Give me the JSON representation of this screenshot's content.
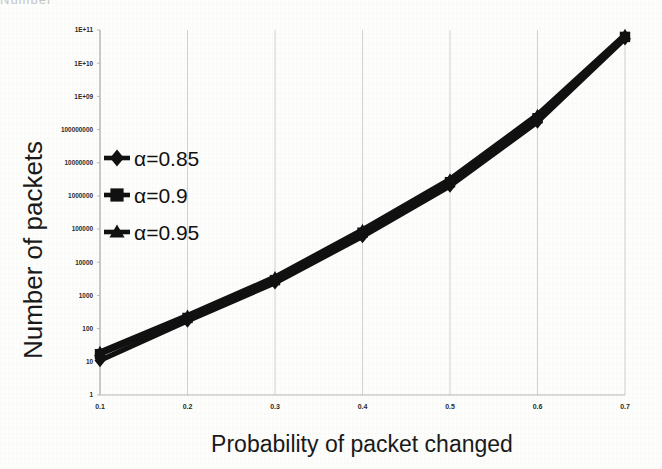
{
  "clipped_header": "Number",
  "chart_data": {
    "type": "line",
    "title": "",
    "xlabel": "Probability of  packet  changed",
    "ylabel": "Number of packets",
    "xscale": "linear",
    "yscale": "log",
    "xlim": [
      0.1,
      0.7
    ],
    "ylim": [
      1,
      100000000000
    ],
    "grid": true,
    "legend_position": "upper-left-inside",
    "x": [
      0.1,
      0.2,
      0.3,
      0.4,
      0.5,
      0.6,
      0.7
    ],
    "xtick_labels": [
      "0.1",
      "0.2",
      "0.3",
      "0.4",
      "0.5",
      "0.6",
      "0.7"
    ],
    "ytick_labels": [
      "1",
      "10",
      "100",
      "1000",
      "10000",
      "100000",
      "1000000",
      "10000000",
      "100000000",
      "1E+09",
      "1E+10",
      "1E+11"
    ],
    "ytick_values": [
      1,
      10,
      100,
      1000,
      10000,
      100000,
      1000000,
      10000000,
      100000000,
      1000000000,
      10000000000,
      100000000000
    ],
    "series": [
      {
        "name": "α=0.85",
        "marker": "diamond",
        "color": "#111111",
        "values": [
          11,
          170,
          2400,
          60000,
          2000000,
          170000000,
          55000000000
        ]
      },
      {
        "name": "α=0.9",
        "marker": "square",
        "color": "#111111",
        "values": [
          17,
          210,
          2900,
          78000,
          2600000,
          220000000,
          62000000000
        ]
      },
      {
        "name": "α=0.95",
        "marker": "triangle",
        "color": "#111111",
        "values": [
          20,
          250,
          3600,
          95000,
          3200000,
          280000000,
          72000000000
        ]
      }
    ]
  },
  "legend": {
    "items": [
      {
        "label": "α=0.85",
        "marker": "diamond"
      },
      {
        "label": "α=0.9",
        "marker": "square"
      },
      {
        "label": "α=0.95",
        "marker": "triangle"
      }
    ]
  },
  "colors": {
    "series": "#111111",
    "grid": "#d2d2d2",
    "axis": "#b8b8b8",
    "text": "#1a1a1a",
    "background": "#fdfdfb"
  }
}
